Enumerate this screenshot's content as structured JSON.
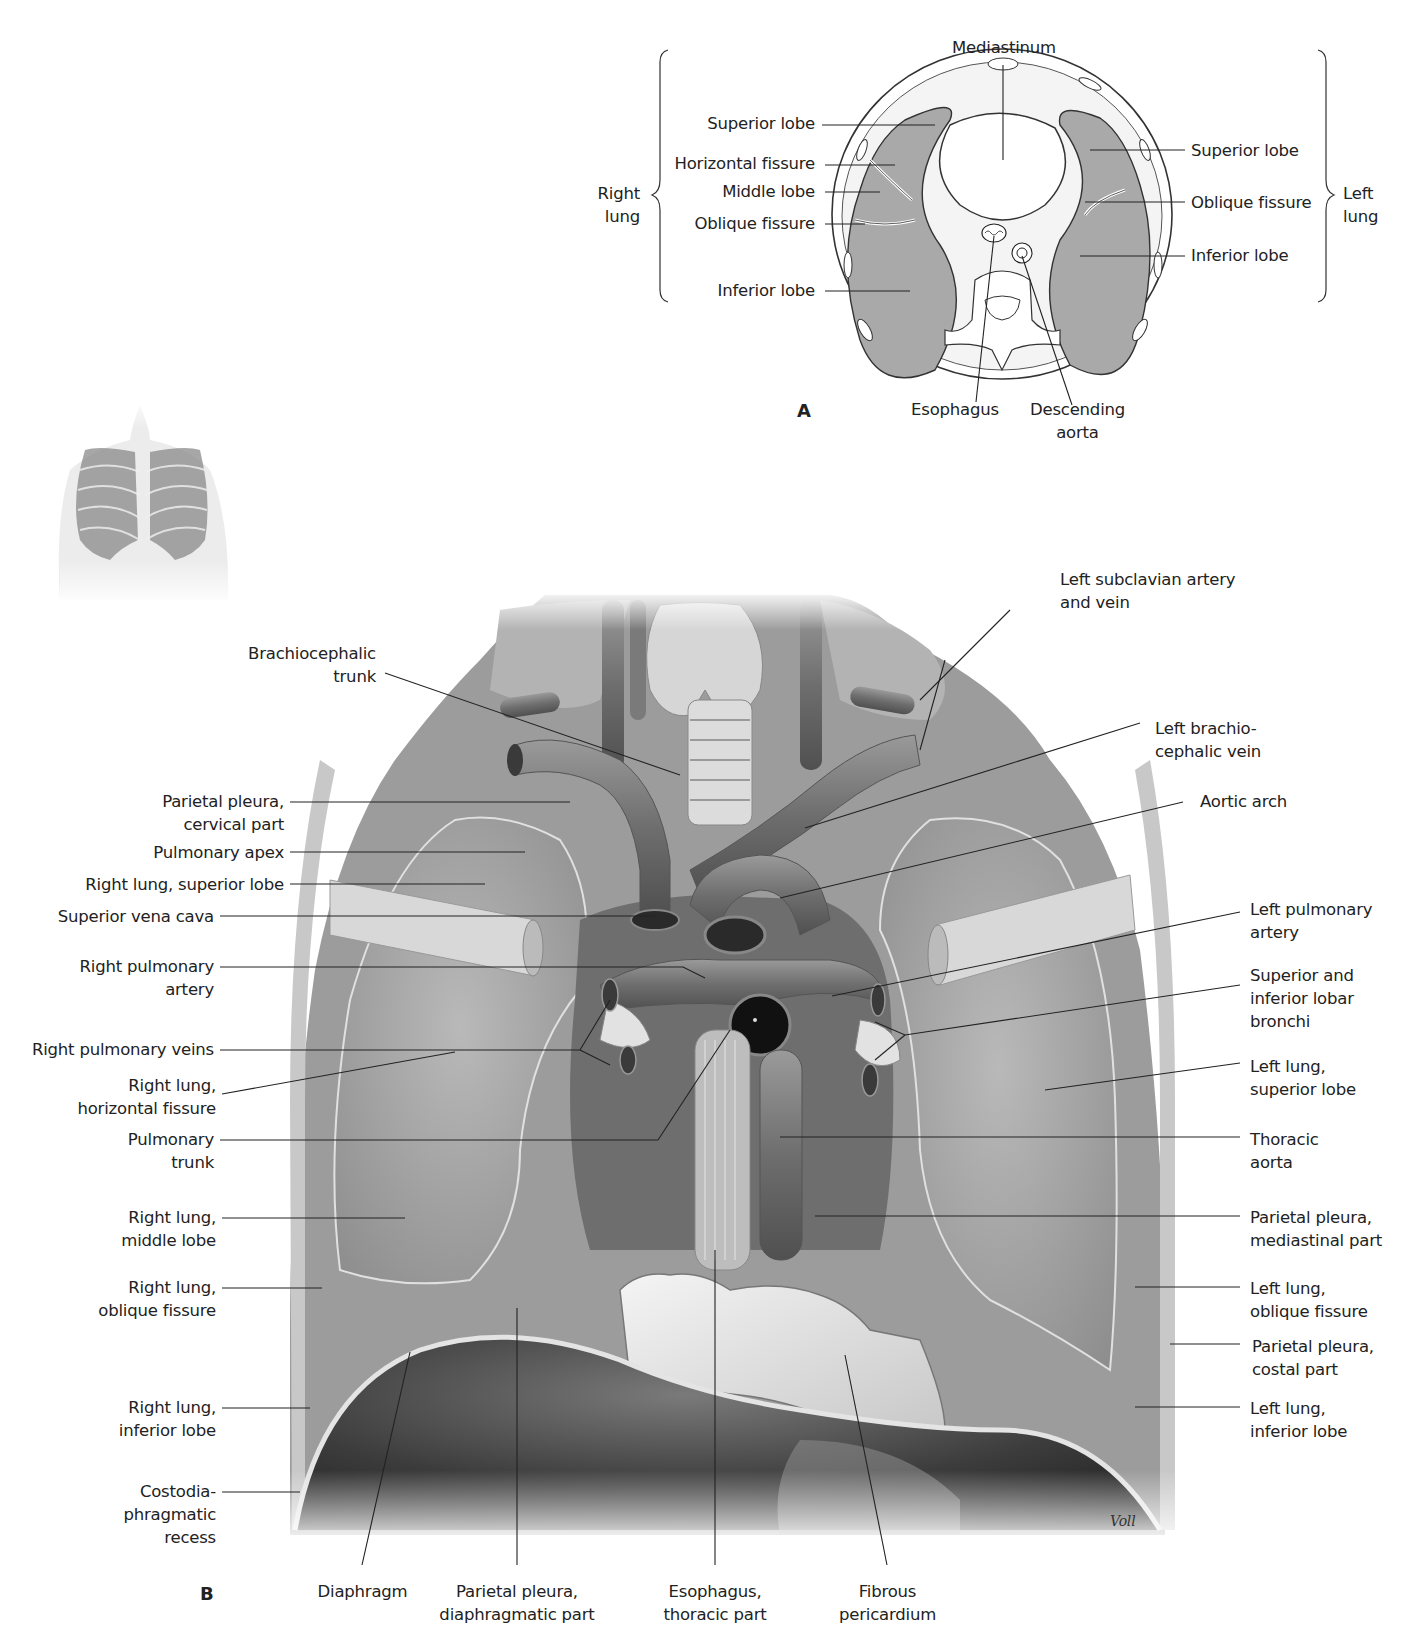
{
  "figure": {
    "panel_a": {
      "letter": "A",
      "top_label": "Mediastinum",
      "right_lung_group": "Right\nlung",
      "left_lung_group": "Left\nlung",
      "right_labels": [
        "Superior lobe",
        "Horizontal fissure",
        "Middle lobe",
        "Oblique fissure",
        "Inferior lobe"
      ],
      "left_labels": [
        "Superior lobe",
        "Oblique fissure",
        "Inferior lobe"
      ],
      "bottom_labels": [
        "Esophagus",
        "Descending\naorta"
      ]
    },
    "panel_b": {
      "letter": "B",
      "signature": "Voll",
      "left_labels": [
        "Brachiocephalic\ntrunk",
        "Parietal pleura,\ncervical part",
        "Pulmonary apex",
        "Right lung, superior lobe",
        "Superior vena cava",
        "Right pulmonary\nartery",
        "Right pulmonary veins",
        "Right lung,\nhorizontal fissure",
        "Pulmonary\ntrunk",
        "Right lung,\nmiddle lobe",
        "Right lung,\noblique fissure",
        "Right lung,\ninferior lobe",
        "Costodia-\nphragmatic\nrecess"
      ],
      "right_labels": [
        "Left subclavian artery\nand vein",
        "Left brachio-\ncephalic vein",
        "Aortic arch",
        "Left pulmonary\nartery",
        "Superior and\ninferior lobar\nbronchi",
        "Left lung,\nsuperior lobe",
        "Thoracic\naorta",
        "Parietal pleura,\nmediastinal part",
        "Left lung,\noblique fissure",
        "Parietal pleura,\ncostal part",
        "Left lung,\ninferior lobe"
      ],
      "bottom_labels": [
        "Diaphragm",
        "Parietal pleura,\ndiaphragmatic part",
        "Esophagus,\nthoracic part",
        "Fibrous\npericardium"
      ]
    },
    "orientation_thumbnail": "thorax-with-lungs-anterior-view"
  }
}
